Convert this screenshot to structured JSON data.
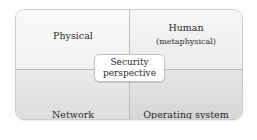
{
  "diagram": {
    "type": "quadrant",
    "quadrants": {
      "top_left": {
        "label": "Physical"
      },
      "top_right": {
        "label": "Human",
        "sublabel": "(metaphysical)"
      },
      "bottom_left": {
        "label": "Network"
      },
      "bottom_right": {
        "label": "Operating system"
      }
    },
    "center": {
      "line1": "Security",
      "line2": "perspective"
    }
  },
  "colors": {
    "divider": "#bcbcbc",
    "fill_light": "#f8f8f8",
    "fill_dark": "#d8d8d8",
    "center_fill": "#ffffff"
  }
}
